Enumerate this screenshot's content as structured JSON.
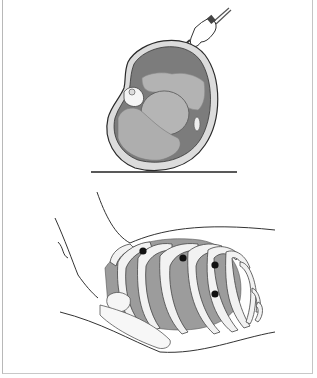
{
  "figure": {
    "panels": [
      {
        "id": "top",
        "description": "Cross-section of chest in lateral decubitus position with needle/trocar inserted",
        "elements": [
          "chest-wall",
          "lung",
          "heart",
          "lower-lung",
          "spine",
          "needle",
          "ground-line"
        ]
      },
      {
        "id": "bottom",
        "description": "Lateral view of rib cage with patient arm raised, showing port insertion sites",
        "port_sites": [
          {
            "x": 143,
            "y": 251
          },
          {
            "x": 183,
            "y": 258
          },
          {
            "x": 215,
            "y": 265
          },
          {
            "x": 215,
            "y": 294
          }
        ]
      }
    ],
    "colors": {
      "outline": "#2a2a2a",
      "chest_wall": "#d9d9d9",
      "cavity": "#7a7a7a",
      "organ": "#b0b0b0",
      "rib": "#f2f2f2",
      "port_dot": "#111111",
      "border": "#bcbcbc"
    }
  }
}
